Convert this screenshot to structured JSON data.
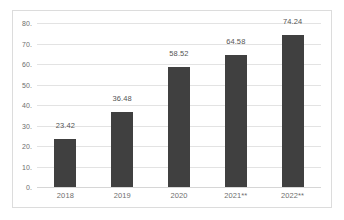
{
  "chart_data": {
    "type": "bar",
    "title": "",
    "subtitle": "",
    "xlabel": "",
    "ylabel": "",
    "categories": [
      "2018",
      "2019",
      "2020",
      "2021**",
      "2022**"
    ],
    "values": [
      23.42,
      36.48,
      58.52,
      64.58,
      74.24
    ],
    "data_labels": [
      "23.42",
      "36.48",
      "58.52",
      "64.58",
      "74.24"
    ],
    "ylim": [
      0,
      80
    ],
    "ytick_values": [
      80,
      70,
      60,
      50,
      40,
      30,
      20,
      10,
      0
    ],
    "ytick_labels": [
      "80.",
      "70.",
      "60.",
      "50.",
      "40.",
      "30.",
      "20.",
      "10.",
      "0."
    ],
    "grid": "horizontal",
    "legend": "none",
    "series": [
      {
        "name": "",
        "values": [
          23.42,
          36.48,
          58.52,
          64.58,
          74.24
        ],
        "color": "#404040"
      }
    ],
    "colors": {
      "bar": "#404040",
      "gridline": "#e3e3e3",
      "axis_text": "#6e6e6e",
      "label_text": "#555555",
      "border": "#dcdcdc",
      "background": "#ffffff"
    }
  }
}
